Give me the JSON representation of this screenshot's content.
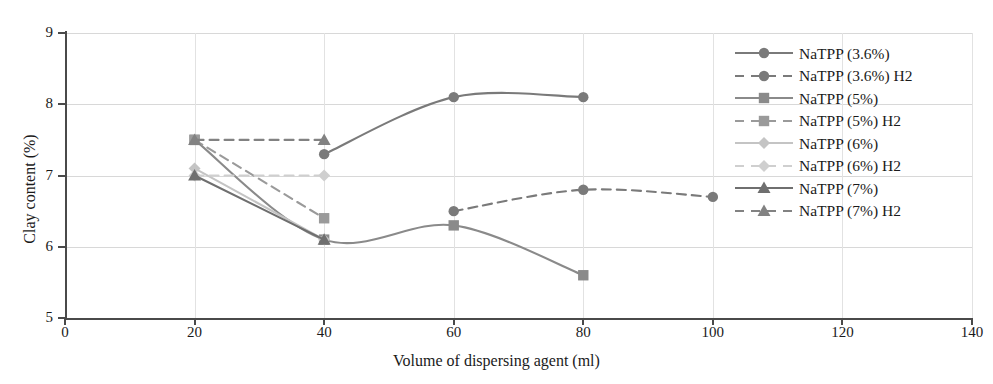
{
  "chart_data": {
    "type": "line",
    "title": "",
    "xlabel": "Volume of dispersing agent (ml)",
    "ylabel": "Clay content (%)",
    "xlim": [
      0,
      140
    ],
    "ylim": [
      5,
      9
    ],
    "xticks": [
      0,
      20,
      40,
      60,
      80,
      100,
      120,
      140
    ],
    "yticks": [
      5,
      6,
      7,
      8,
      9
    ],
    "grid": true,
    "legend_position": "top-right",
    "series": [
      {
        "name": "NaTPP (3.6%)",
        "marker": "circle",
        "linestyle": "solid",
        "color": "#7a7a7a",
        "x": [
          40,
          60,
          80
        ],
        "values": [
          7.3,
          8.1,
          8.1
        ]
      },
      {
        "name": "NaTPP (3.6%) H2",
        "marker": "circle",
        "linestyle": "dashed",
        "color": "#7a7a7a",
        "x": [
          60,
          80,
          100
        ],
        "values": [
          6.5,
          6.8,
          6.7
        ]
      },
      {
        "name": "NaTPP (5%)",
        "marker": "square",
        "linestyle": "solid",
        "color": "#8a8a8a",
        "x": [
          20,
          40,
          60,
          80
        ],
        "values": [
          7.5,
          6.1,
          6.3,
          5.6
        ]
      },
      {
        "name": "NaTPP (5%) H2",
        "marker": "square",
        "linestyle": "dashed",
        "color": "#9a9a9a",
        "x": [
          20,
          40
        ],
        "values": [
          7.5,
          6.4
        ]
      },
      {
        "name": "NaTPP (6%)",
        "marker": "diamond",
        "linestyle": "solid",
        "color": "#c4c4c4",
        "x": [
          20,
          40
        ],
        "values": [
          7.1,
          6.1
        ]
      },
      {
        "name": "NaTPP (6%) H2",
        "marker": "diamond",
        "linestyle": "dashed",
        "color": "#cfcfcf",
        "x": [
          20,
          40
        ],
        "values": [
          7.0,
          7.0
        ]
      },
      {
        "name": "NaTPP (7%)",
        "marker": "triangle",
        "linestyle": "solid",
        "color": "#6f6f6f",
        "x": [
          20,
          40
        ],
        "values": [
          7.0,
          6.1
        ]
      },
      {
        "name": "NaTPP (7%) H2",
        "marker": "triangle",
        "linestyle": "dashed",
        "color": "#828282",
        "x": [
          20,
          40
        ],
        "values": [
          7.5,
          7.5
        ]
      }
    ]
  },
  "axes": {
    "x_tick_labels": [
      "0",
      "20",
      "40",
      "60",
      "80",
      "100",
      "120",
      "140"
    ],
    "y_tick_labels": [
      "5",
      "6",
      "7",
      "8",
      "9"
    ],
    "x_title": "Volume of dispersing agent (ml)",
    "y_title": "Clay content (%)"
  },
  "legend": {
    "entries": [
      {
        "label": "NaTPP (3.6%)"
      },
      {
        "label": "NaTPP (3.6%) H2"
      },
      {
        "label": "NaTPP (5%)"
      },
      {
        "label": "NaTPP (5%) H2"
      },
      {
        "label": "NaTPP (6%)"
      },
      {
        "label": "NaTPP (6%) H2"
      },
      {
        "label": "NaTPP (7%)"
      },
      {
        "label": "NaTPP (7%) H2"
      }
    ]
  }
}
